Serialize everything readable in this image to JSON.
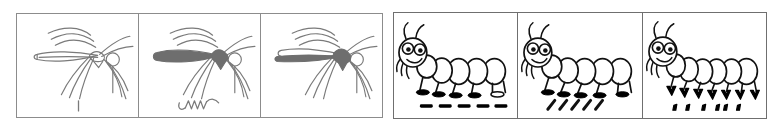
{
  "figure": {
    "background_color": "#ffffff",
    "width": 772,
    "height": 129
  },
  "groups": [
    {
      "id": "mosquitoes",
      "name": "mosquito-panel-group",
      "border_color": "#8c8c8c",
      "ink_color": "#7a7a7a",
      "fill_color": "#6e6e6e",
      "panels": [
        {
          "index": 1,
          "subject": "mosquito",
          "body_fill": "none",
          "body_fill_label": "outline only",
          "legs": 6,
          "mark_below": "single-vertical-stroke",
          "mark_count": 1,
          "caption": "Mosquito outline, unshaded body, one short vertical stroke below"
        },
        {
          "index": 2,
          "subject": "mosquito",
          "body_fill": "solid",
          "body_fill_label": "fully shaded abdomen and wing",
          "legs": 6,
          "mark_below": "squiggle-zigzag",
          "mark_count": 1,
          "caption": "Mosquito with fully shaded body, squiggly zigzag mark below"
        },
        {
          "index": 3,
          "subject": "mosquito",
          "body_fill": "partial",
          "body_fill_label": "shaded abdomen, outlined wing",
          "legs": 6,
          "mark_below": "none",
          "mark_count": 0,
          "caption": "Mosquito with shaded abdomen and outlined wing, no mark below"
        }
      ]
    },
    {
      "id": "caterpillars",
      "name": "caterpillar-panel-group",
      "border_color": "#6f6f6f",
      "ink_color": "#111111",
      "fill_color": "#000000",
      "panels": [
        {
          "index": 1,
          "subject": "caterpillar",
          "segments": 5,
          "feet": 5,
          "feet_style": "solid-oval-shoes",
          "mark_below": "horizontal-dashes",
          "mark_count": 5,
          "caption": "Caterpillar with five segments and five horizontal dash marks below"
        },
        {
          "index": 2,
          "subject": "caterpillar",
          "segments": 5,
          "feet": 5,
          "feet_style": "solid-oval-shoes",
          "mark_below": "diagonal-slashes",
          "mark_count": 5,
          "caption": "Caterpillar with five segments and five diagonal slash marks below"
        },
        {
          "index": 3,
          "subject": "caterpillar",
          "segments": 6,
          "feet": 7,
          "feet_style": "v-shaped-checks",
          "mark_below": "comma-dots",
          "mark_count": 6,
          "caption": "Caterpillar with six segments, V-shaped feet, and six small comma dots below"
        }
      ]
    }
  ]
}
